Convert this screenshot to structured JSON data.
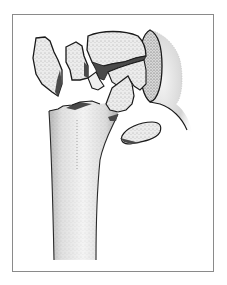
{
  "illustration": {
    "subject": "proximal-humerus-fracture",
    "fragments": [
      "greater-tuberosity-fragment-left",
      "small-fragment-left",
      "humeral-head-fragment",
      "lesser-fragment-center",
      "tuberosity-fragment-right",
      "glenoid",
      "humeral-shaft"
    ],
    "colors": {
      "outline": "#1a1a1a",
      "bone_fill": "#ececec",
      "bone_highlight": "#f8f8f8",
      "stipple": "#6a6a6a",
      "fracture_surface": "#4a4a4a",
      "frame_border": "#8a8a8a",
      "background": "#ffffff"
    }
  }
}
